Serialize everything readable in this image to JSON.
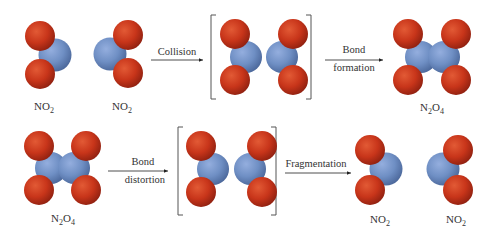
{
  "diagram": {
    "colors": {
      "oxygen": "#c8351a",
      "nitrogen": "#6f8fc4",
      "bracket": "#555555",
      "arrow": "#222222",
      "text": "#333333",
      "background": "#ffffff"
    },
    "top_row": {
      "molecules": [
        {
          "id": "no2-1",
          "formula": "NO",
          "subscript": "2"
        },
        {
          "id": "no2-2",
          "formula": "NO",
          "subscript": "2"
        },
        {
          "id": "transition-state-1",
          "formula": "",
          "bracketed": true
        },
        {
          "id": "n2o4-product",
          "formula_parts": [
            "N",
            "2",
            "O",
            "4"
          ]
        }
      ],
      "arrows": [
        {
          "id": "collision-arrow",
          "label_lines": [
            "Collision"
          ]
        },
        {
          "id": "bond-formation-arrow",
          "label_lines": [
            "Bond",
            "formation"
          ]
        }
      ]
    },
    "bottom_row": {
      "molecules": [
        {
          "id": "n2o4-reactant",
          "formula_parts": [
            "N",
            "2",
            "O",
            "4"
          ]
        },
        {
          "id": "transition-state-2",
          "formula": "",
          "bracketed": true
        },
        {
          "id": "no2-3",
          "formula": "NO",
          "subscript": "2"
        },
        {
          "id": "no2-4",
          "formula": "NO",
          "subscript": "2"
        }
      ],
      "arrows": [
        {
          "id": "bond-distortion-arrow",
          "label_lines": [
            "Bond",
            "distortion"
          ]
        },
        {
          "id": "fragmentation-arrow",
          "label_lines": [
            "Fragmentation"
          ]
        }
      ]
    },
    "labels": {
      "no2_main": "NO",
      "no2_sub": "2",
      "n2o4_n": "N",
      "n2o4_sub1": "2",
      "n2o4_o": "O",
      "n2o4_sub2": "4",
      "collision": "Collision",
      "bond": "Bond",
      "formation": "formation",
      "distortion": "distortion",
      "fragmentation": "Fragmentation"
    }
  }
}
